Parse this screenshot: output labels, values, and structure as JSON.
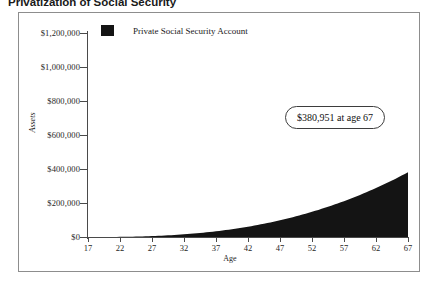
{
  "title": "Privatization of Social Security",
  "legend": {
    "swatch_color": "#141414",
    "label": "Private Social Security Account"
  },
  "annotation": {
    "text": "$380,951 at age 67"
  },
  "axes": {
    "ylabel": "Assets",
    "xlabel": "Age"
  },
  "chart_data": {
    "type": "area",
    "title": "Privatization of Social Security",
    "subtitle": "",
    "xlabel": "Age",
    "ylabel": "Assets",
    "xlim": [
      17,
      67
    ],
    "ylim": [
      0,
      1200000
    ],
    "grid": false,
    "legend_position": "top-left",
    "fill_color": "#141414",
    "x_ticklabels": [
      "17",
      "22",
      "27",
      "32",
      "37",
      "42",
      "47",
      "52",
      "57",
      "62",
      "67"
    ],
    "x_ticks": [
      17,
      22,
      27,
      32,
      37,
      42,
      47,
      52,
      57,
      62,
      67
    ],
    "y_ticklabels": [
      "$0",
      "$200,000",
      "$400,000",
      "$600,000",
      "$800,000",
      "$1,000,000",
      "$1,200,000"
    ],
    "y_ticks": [
      0,
      200000,
      400000,
      600000,
      800000,
      1000000,
      1200000
    ],
    "annotations": [
      {
        "text": "$380,951 at age 67",
        "x": 55,
        "y": 640000
      }
    ],
    "series": [
      {
        "name": "Private Social Security Account",
        "x": [
          17,
          19,
          21,
          23,
          25,
          27,
          29,
          31,
          33,
          35,
          37,
          39,
          41,
          43,
          45,
          47,
          49,
          51,
          53,
          55,
          57,
          59,
          61,
          63,
          65,
          67
        ],
        "values": [
          0,
          4200,
          9100,
          14800,
          21400,
          29200,
          38200,
          48700,
          61000,
          75300,
          92000,
          111400,
          134000,
          160300,
          190700,
          226000,
          266800,
          313900,
          368100,
          430300,
          501500,
          583000,
          676300,
          782900,
          905000,
          380951
        ]
      }
    ],
    "final_value": 380951,
    "final_age": 67,
    "note": "Exponentially growing account balance reaching $380,951 at age 67"
  }
}
